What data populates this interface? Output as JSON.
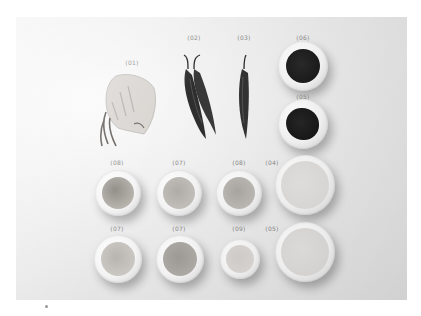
{
  "photo": {
    "description": "Overhead photo of ingredients arranged on a light gray surface, each labeled with a numbered tag",
    "background_color": "#e6e6e6"
  },
  "items": [
    {
      "id": "squid",
      "label": "(01)"
    },
    {
      "id": "chili-pair",
      "label": "(02)"
    },
    {
      "id": "chili-single",
      "label": "(03)"
    },
    {
      "id": "bowl-dark-top",
      "label": "(06)"
    },
    {
      "id": "bowl-dark-bottom",
      "label": "(05)"
    },
    {
      "id": "bowl-r1c1",
      "label": "(08)"
    },
    {
      "id": "bowl-r1c2",
      "label": "(07)"
    },
    {
      "id": "bowl-r1c3",
      "label": "(08)"
    },
    {
      "id": "bowl-r1c4",
      "label": "(04)"
    },
    {
      "id": "bowl-r2c1",
      "label": "(07)"
    },
    {
      "id": "bowl-r2c2",
      "label": "(07)"
    },
    {
      "id": "bowl-r2c3",
      "label": "(09)"
    },
    {
      "id": "bowl-r2c4",
      "label": "(05)"
    }
  ],
  "colors": {
    "dark_paste": "#1e1e1e",
    "chili": "#2e2e2e",
    "label_text": "#8a8a8a"
  }
}
